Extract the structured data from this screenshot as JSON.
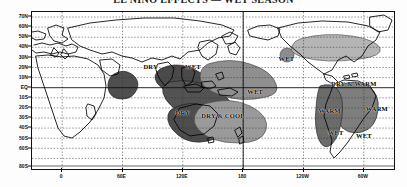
{
  "title": "EL NIÑO EFFECTS — WET SEASON",
  "map": {
    "projection": "equirectangular",
    "lon_range": [
      -30,
      330
    ],
    "lat_range": [
      -80,
      75
    ],
    "grid": "dashed",
    "grid_color": "#2b2b2b",
    "coast_color": "#000000",
    "frame_color": "#111111",
    "background": "#ffffff"
  },
  "axes": {
    "y_label_suffix": "",
    "y_ticks": [
      {
        "label": "70N",
        "lat": 70
      },
      {
        "label": "60N",
        "lat": 60
      },
      {
        "label": "50N",
        "lat": 50
      },
      {
        "label": "40N",
        "lat": 40
      },
      {
        "label": "30N",
        "lat": 30
      },
      {
        "label": "20N",
        "lat": 20
      },
      {
        "label": "10N",
        "lat": 10
      },
      {
        "label": "EQ",
        "lat": 0
      },
      {
        "label": "10S",
        "lat": -10
      },
      {
        "label": "20S",
        "lat": -20
      },
      {
        "label": "30S",
        "lat": -30
      },
      {
        "label": "40S",
        "lat": -40
      },
      {
        "label": "50S",
        "lat": -50
      },
      {
        "label": "60S",
        "lat": -60
      },
      {
        "label": "80S",
        "lat": -78
      }
    ],
    "x_ticks": [
      {
        "label": "0",
        "lon": 0
      },
      {
        "label": "60E",
        "lon": 60
      },
      {
        "label": "120E",
        "lon": 120
      },
      {
        "label": "180",
        "lon": 180
      },
      {
        "label": "120W",
        "lon": 240
      },
      {
        "label": "60W",
        "lon": 300
      }
    ]
  },
  "colors": {
    "dark_shade": "#5a5a5a",
    "mid_shade": "#8d8d8d",
    "light_shade": "#b4b4b4",
    "blob_outline": "#2a2a2a",
    "coast": "#000000",
    "grid": "#333333"
  },
  "annotations": [
    {
      "id": "dry-india",
      "text": "DRY",
      "lon": 88,
      "lat": 22,
      "shade": "dark"
    },
    {
      "id": "wet-ecpacific",
      "text": "WET",
      "lon": 130,
      "lat": 22,
      "shade": "mid"
    },
    {
      "id": "dry-australia",
      "text": "DRY",
      "lon": 120,
      "lat": -24,
      "shade": "dark"
    },
    {
      "id": "dry-cool-seas",
      "text": "DRY & COOL",
      "lon": 160,
      "lat": -27,
      "shade": "mid"
    },
    {
      "id": "wet-npacific",
      "text": "WET",
      "lon": 223,
      "lat": 30,
      "shade": "light"
    },
    {
      "id": "wet-spacific",
      "text": "WET",
      "lon": 192,
      "lat": -3,
      "shade": "light"
    },
    {
      "id": "dry-warm-camer",
      "text": "DRY & WARM",
      "lon": 290,
      "lat": 5,
      "shade": "light"
    },
    {
      "id": "warm-cpacific",
      "text": "WARM",
      "lon": 266,
      "lat": -22,
      "shade": "none"
    },
    {
      "id": "warm-brazil",
      "text": "WARM",
      "lon": 313,
      "lat": -20,
      "shade": "mid"
    },
    {
      "id": "wet-peru",
      "text": "WET",
      "lon": 272,
      "lat": -43,
      "shade": "none"
    },
    {
      "id": "wet-argentina",
      "text": "WET",
      "lon": 300,
      "lat": -46,
      "shade": "none"
    }
  ],
  "blobs": [
    {
      "id": "blob-east-africa",
      "shade": "dark"
    },
    {
      "id": "blob-india-sea",
      "shade": "dark"
    },
    {
      "id": "blob-maritime",
      "shade": "dark"
    },
    {
      "id": "blob-wpacific-wet",
      "shade": "mid"
    },
    {
      "id": "blob-australia-dry",
      "shade": "dark"
    },
    {
      "id": "blob-dry-cool",
      "shade": "mid"
    },
    {
      "id": "blob-npacific-dot",
      "shade": "mid"
    },
    {
      "id": "blob-camerica",
      "shade": "light"
    },
    {
      "id": "blob-brazil",
      "shade": "mid"
    },
    {
      "id": "blob-scone",
      "shade": "mid"
    }
  ]
}
